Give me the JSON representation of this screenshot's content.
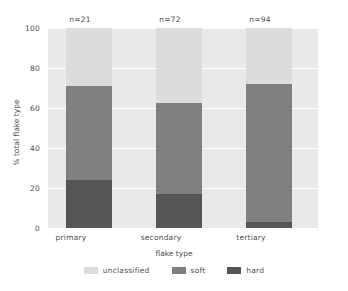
{
  "chart_data": {
    "type": "bar",
    "subtype": "stacked-bar-percent",
    "title": "",
    "xlabel": "flake type",
    "ylabel": "% total flake type",
    "categories": [
      "primary",
      "secondary",
      "tertiary"
    ],
    "annotations": [
      "n=21",
      "n=72",
      "n=94"
    ],
    "series": [
      {
        "name": "unclassified",
        "color": "#dcdcdc",
        "values": [
          29,
          37.5,
          28
        ]
      },
      {
        "name": "soft",
        "color": "#808080",
        "values": [
          47,
          45.5,
          69
        ]
      },
      {
        "name": "hard",
        "color": "#555555",
        "values": [
          24,
          17,
          3
        ]
      }
    ],
    "cumulative_tops": {
      "hard": [
        24,
        17,
        3
      ],
      "soft": [
        71,
        62.5,
        72
      ],
      "unclassified": [
        100,
        100,
        100
      ]
    },
    "ylim": [
      0,
      100
    ],
    "yticks": [
      0,
      20,
      40,
      60,
      80,
      100
    ],
    "ytick_labels": [
      "0",
      "20",
      "40",
      "60",
      "80",
      "100"
    ],
    "grid": true,
    "grid_color": "#ffffff",
    "plot_background": "#e9e9e9",
    "legend_position": "bottom",
    "legend": [
      {
        "label": "unclassified",
        "color": "#dcdcdc"
      },
      {
        "label": "soft",
        "color": "#808080"
      },
      {
        "label": "hard",
        "color": "#555555"
      }
    ]
  }
}
